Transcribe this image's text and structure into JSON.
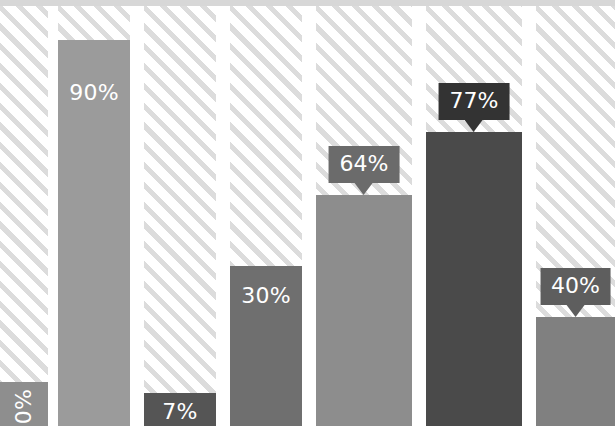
{
  "chart_data": {
    "type": "bar",
    "title": "",
    "subtitle": "",
    "xlabel": "",
    "ylabel": "",
    "ylim": [
      0,
      100
    ],
    "grid": false,
    "legend": null,
    "unit": "%",
    "orientation": "vertical",
    "categories": [
      "1",
      "2",
      "3",
      "4",
      "5",
      "6",
      "7"
    ],
    "values": [
      0,
      90,
      7,
      30,
      64,
      77,
      40
    ],
    "labels": [
      "0%",
      "90%",
      "7%",
      "30%",
      "64%",
      "77%",
      "40%"
    ],
    "bar_colors": [
      "#8e8e8e",
      "#9b9b9b",
      "#555555",
      "#6f6f6f",
      "#8d8d8d",
      "#4a4a4a",
      "#808080"
    ],
    "track_pattern": "diagonal-hatch",
    "track_stripe_color": "#dcdcdc",
    "track_background_color": "#ffffff"
  },
  "bars": [
    {
      "name": "bar-1",
      "label": "0%",
      "value": 0,
      "color": "#8e8e8e",
      "label_style": "inside-vertical",
      "label_color": "#ffffff",
      "left": 0,
      "width": 48,
      "bar_height": 44,
      "label_bottom": 2
    },
    {
      "name": "bar-2",
      "label": "90%",
      "value": 90,
      "color": "#9b9b9b",
      "label_style": "inside",
      "label_color": "#ffffff",
      "left": 58,
      "width": 72,
      "bar_height": 386,
      "label_bottom": 322
    },
    {
      "name": "bar-3",
      "label": "7%",
      "value": 7,
      "color": "#555555",
      "label_style": "inside",
      "label_color": "#ffffff",
      "left": 144,
      "width": 72,
      "bar_height": 33,
      "label_bottom": 3
    },
    {
      "name": "bar-4",
      "label": "30%",
      "value": 30,
      "color": "#6f6f6f",
      "label_style": "inside",
      "label_color": "#ffffff",
      "left": 230,
      "width": 72,
      "bar_height": 160,
      "label_bottom": 119
    },
    {
      "name": "bar-5",
      "label": "64%",
      "value": 64,
      "color": "#8d8d8d",
      "label_style": "callout",
      "label_color": "#ffffff",
      "callout_color": "#6b6b6b",
      "left": 316,
      "width": 96,
      "bar_height": 231,
      "callout_bottom": 243
    },
    {
      "name": "bar-6",
      "label": "77%",
      "value": 77,
      "color": "#4a4a4a",
      "label_style": "callout",
      "label_color": "#ffffff",
      "callout_color": "#333333",
      "left": 426,
      "width": 96,
      "bar_height": 294,
      "callout_bottom": 306
    },
    {
      "name": "bar-7",
      "label": "40%",
      "value": 40,
      "color": "#808080",
      "label_style": "callout",
      "label_color": "#ffffff",
      "callout_color": "#5e5e5e",
      "left": 536,
      "width": 79,
      "bar_height": 109,
      "callout_bottom": 121
    }
  ],
  "tracks": [
    {
      "name": "track-1",
      "left": 0,
      "width": 48
    },
    {
      "name": "track-2",
      "left": 58,
      "width": 72
    },
    {
      "name": "track-3",
      "left": 144,
      "width": 72
    },
    {
      "name": "track-4",
      "left": 230,
      "width": 72
    },
    {
      "name": "track-5",
      "left": 316,
      "width": 96
    },
    {
      "name": "track-6",
      "left": 426,
      "width": 96
    },
    {
      "name": "track-7",
      "left": 536,
      "width": 79
    }
  ]
}
